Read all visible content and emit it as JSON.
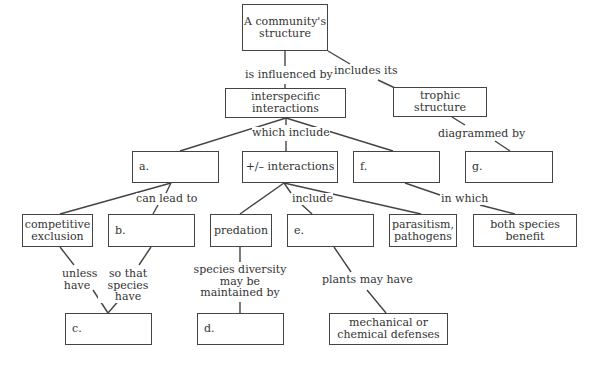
{
  "diagram": {
    "nodes": {
      "community": "A community's structure",
      "interspecific": "interspecific interactions",
      "trophic": "trophic structure",
      "a": "a.",
      "plusminus": "+/– interactions",
      "f": "f.",
      "g": "g.",
      "competitive": "competitive exclusion",
      "b": "b.",
      "predation": "predation",
      "e": "e.",
      "parasitism": "parasitism, pathogens",
      "both_benefit": "both species benefit",
      "c": "c.",
      "d": "d.",
      "defenses": "mechanical or chemical defenses"
    },
    "links": {
      "is_influenced_by": "is influenced by",
      "includes_its": "includes its",
      "which_include": "which include",
      "diagrammed_by": "diagrammed by",
      "can_lead_to": "can lead to",
      "include1": "include",
      "in_which": "in which",
      "unless_have": "unless have",
      "so_that": "so that species have",
      "species_diversity": "species diversity may be maintained by",
      "plants_may_have": "plants may have"
    }
  }
}
